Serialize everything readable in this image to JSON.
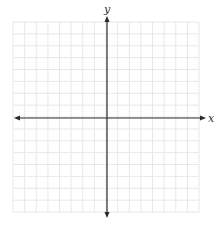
{
  "diagram": {
    "type": "coordinate-plane",
    "grid": {
      "squares_x": 16,
      "squares_y": 16,
      "visible": true,
      "color": "#e8e8e8"
    },
    "axes": {
      "color": "#2a2a2a",
      "x": {
        "label": "x",
        "arrows": "both"
      },
      "y": {
        "label": "y",
        "arrows": "both"
      }
    },
    "tick_labels": false,
    "plotted_content": []
  }
}
